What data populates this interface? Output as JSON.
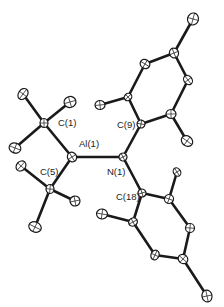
{
  "diagram": {
    "type": "ORTEP molecular structure",
    "colors": {
      "bond": "#1a1a1a",
      "atom_fill": "#ffffff",
      "label": "#222222"
    },
    "labels": [
      {
        "id": "C1",
        "text": "C(1)",
        "x": 58,
        "y": 126
      },
      {
        "id": "Al1",
        "text": "Al(1)",
        "x": 79,
        "y": 147
      },
      {
        "id": "C5",
        "text": "C(5)",
        "x": 40,
        "y": 175
      },
      {
        "id": "N1",
        "text": "N(1)",
        "x": 107,
        "y": 175
      },
      {
        "id": "C9",
        "text": "C(9)",
        "x": 117,
        "y": 128
      },
      {
        "id": "C18",
        "text": "C(18)",
        "x": 116,
        "y": 200
      }
    ],
    "atoms": [
      {
        "id": "C1",
        "x": 44,
        "y": 123,
        "rx": 4.5,
        "ry": 4
      },
      {
        "id": "C1a",
        "x": 23,
        "y": 94,
        "rx": 6,
        "ry": 4.5
      },
      {
        "id": "C1b",
        "x": 70,
        "y": 102,
        "rx": 6,
        "ry": 5.5
      },
      {
        "id": "C1c",
        "x": 15,
        "y": 148,
        "rx": 6,
        "ry": 5
      },
      {
        "id": "Al1",
        "x": 72,
        "y": 157,
        "rx": 5,
        "ry": 4.5
      },
      {
        "id": "C5",
        "x": 50,
        "y": 189,
        "rx": 4.5,
        "ry": 4
      },
      {
        "id": "C5a",
        "x": 21,
        "y": 166,
        "rx": 5.5,
        "ry": 4.5
      },
      {
        "id": "C5b",
        "x": 75,
        "y": 201,
        "rx": 5,
        "ry": 5
      },
      {
        "id": "C5c",
        "x": 35,
        "y": 227,
        "rx": 6.5,
        "ry": 5
      },
      {
        "id": "N1",
        "x": 123,
        "y": 157,
        "rx": 4,
        "ry": 4
      },
      {
        "id": "C9",
        "x": 141,
        "y": 124,
        "rx": 4,
        "ry": 4
      },
      {
        "id": "C10",
        "x": 128,
        "y": 97,
        "rx": 4,
        "ry": 3.5
      },
      {
        "id": "C10m",
        "x": 100,
        "y": 105,
        "rx": 5,
        "ry": 4.5
      },
      {
        "id": "C11",
        "x": 145,
        "y": 64,
        "rx": 5,
        "ry": 4.5
      },
      {
        "id": "C12",
        "x": 174,
        "y": 53,
        "rx": 5,
        "ry": 4.5
      },
      {
        "id": "C12m",
        "x": 193,
        "y": 19,
        "rx": 6,
        "ry": 5.5
      },
      {
        "id": "C13",
        "x": 188,
        "y": 80,
        "rx": 4,
        "ry": 5
      },
      {
        "id": "C14",
        "x": 171,
        "y": 114,
        "rx": 5,
        "ry": 4.5
      },
      {
        "id": "C14m",
        "x": 187,
        "y": 141,
        "rx": 6,
        "ry": 5
      },
      {
        "id": "C18",
        "x": 142,
        "y": 193,
        "rx": 4,
        "ry": 4
      },
      {
        "id": "C19",
        "x": 169,
        "y": 199,
        "rx": 4.5,
        "ry": 4.5
      },
      {
        "id": "C19m",
        "x": 177,
        "y": 172,
        "rx": 3.5,
        "ry": 4.5
      },
      {
        "id": "C20",
        "x": 190,
        "y": 228,
        "rx": 4.5,
        "ry": 4.5
      },
      {
        "id": "C21",
        "x": 183,
        "y": 259,
        "rx": 5,
        "ry": 4.5
      },
      {
        "id": "C21m",
        "x": 207,
        "y": 296,
        "rx": 6,
        "ry": 5
      },
      {
        "id": "C22",
        "x": 155,
        "y": 255,
        "rx": 5,
        "ry": 4
      },
      {
        "id": "C23",
        "x": 133,
        "y": 222,
        "rx": 4.5,
        "ry": 4
      },
      {
        "id": "C23m",
        "x": 102,
        "y": 214,
        "rx": 5.5,
        "ry": 5
      }
    ],
    "bonds": [
      [
        "C1",
        "C1a"
      ],
      [
        "C1",
        "C1b"
      ],
      [
        "C1",
        "C1c"
      ],
      [
        "C1",
        "Al1"
      ],
      [
        "Al1",
        "C5"
      ],
      [
        "C5",
        "C5a"
      ],
      [
        "C5",
        "C5b"
      ],
      [
        "C5",
        "C5c"
      ],
      [
        "Al1",
        "N1"
      ],
      [
        "N1",
        "C9"
      ],
      [
        "C9",
        "C10"
      ],
      [
        "C10",
        "C11"
      ],
      [
        "C11",
        "C12"
      ],
      [
        "C12",
        "C13"
      ],
      [
        "C13",
        "C14"
      ],
      [
        "C14",
        "C9"
      ],
      [
        "C10",
        "C10m"
      ],
      [
        "C12",
        "C12m"
      ],
      [
        "C14",
        "C14m"
      ],
      [
        "N1",
        "C18"
      ],
      [
        "C18",
        "C19"
      ],
      [
        "C19",
        "C20"
      ],
      [
        "C20",
        "C21"
      ],
      [
        "C21",
        "C22"
      ],
      [
        "C22",
        "C23"
      ],
      [
        "C23",
        "C18"
      ],
      [
        "C19",
        "C19m"
      ],
      [
        "C21",
        "C21m"
      ],
      [
        "C23",
        "C23m"
      ]
    ]
  }
}
